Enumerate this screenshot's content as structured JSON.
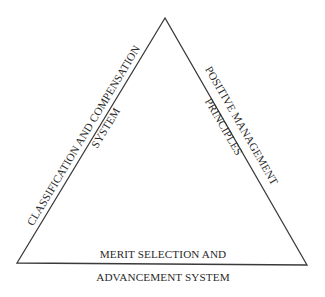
{
  "diagram": {
    "type": "triangle",
    "line_color": "#3a3a3a",
    "text_color": "#2a2a2a",
    "sides": {
      "left": {
        "line1": "CLASSIFICATION AND COMPENSATION",
        "line2": "SYSTEM"
      },
      "right": {
        "line1": "POSITIVE MANAGEMENT",
        "line2": "PRINCIPLES"
      },
      "bottom": {
        "line1": "MERIT SELECTION AND",
        "line2": "ADVANCEMENT SYSTEM"
      }
    }
  }
}
